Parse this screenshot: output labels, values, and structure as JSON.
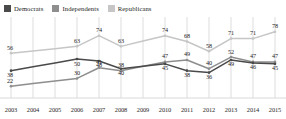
{
  "legend": {
    "items": [
      {
        "label": "Democrats",
        "color": "#4a4a4a",
        "name": "legend-item-democrats"
      },
      {
        "label": "Independents",
        "color": "#8e8e8e",
        "name": "legend-item-independents"
      },
      {
        "label": "Republicans",
        "color": "#c6c6c6",
        "name": "legend-item-republicans"
      }
    ]
  },
  "chart_data": {
    "type": "line",
    "title": "",
    "subtitle": "",
    "xlabel": "",
    "ylabel": "",
    "x": [
      "2003",
      "2004",
      "2005",
      "2006",
      "2007",
      "2008",
      "2009",
      "2010",
      "2011",
      "2012",
      "2013",
      "2014",
      "2015"
    ],
    "categories": [
      "2003",
      "2004",
      "2005",
      "2006",
      "2007",
      "2008",
      "2009",
      "2010",
      "2011",
      "2012",
      "2013",
      "2014",
      "2015"
    ],
    "ylim": [
      15,
      85
    ],
    "grid": "vertical",
    "legend_position": "top-left",
    "series": [
      {
        "name": "Democrats",
        "color": "#4a4a4a",
        "values": [
          38,
          null,
          null,
          50,
          48,
          40,
          null,
          45,
          38,
          36,
          49,
          46,
          45
        ],
        "labels": [
          "38",
          "",
          "",
          "50",
          "48",
          "40",
          "",
          "45",
          "38",
          "36",
          "49",
          "46",
          "45"
        ]
      },
      {
        "name": "Independents",
        "color": "#8e8e8e",
        "values": [
          22,
          null,
          null,
          30,
          41,
          38,
          null,
          47,
          49,
          40,
          52,
          47,
          47
        ],
        "labels": [
          "22",
          "",
          "",
          "30",
          "41",
          "38",
          "",
          "47",
          "49",
          "40",
          "52",
          "47",
          "47"
        ]
      },
      {
        "name": "Republicans",
        "color": "#c6c6c6",
        "values": [
          56,
          null,
          null,
          63,
          74,
          63,
          null,
          74,
          68,
          58,
          71,
          71,
          78
        ],
        "labels": [
          "56",
          "",
          "",
          "63",
          "74",
          "63",
          "",
          "74",
          "68",
          "58",
          "71",
          "71",
          "78"
        ]
      }
    ]
  },
  "axis": {
    "ticks": [
      "2003",
      "2004",
      "2005",
      "2006",
      "2007",
      "2008",
      "2009",
      "2010",
      "2011",
      "2012",
      "2013",
      "2014",
      "2015"
    ]
  },
  "colors": {
    "democrats": "#4a4a4a",
    "independents": "#8e8e8e",
    "republicans": "#c6c6c6",
    "grid": "#cfcfcf",
    "background": "#ffffff"
  }
}
